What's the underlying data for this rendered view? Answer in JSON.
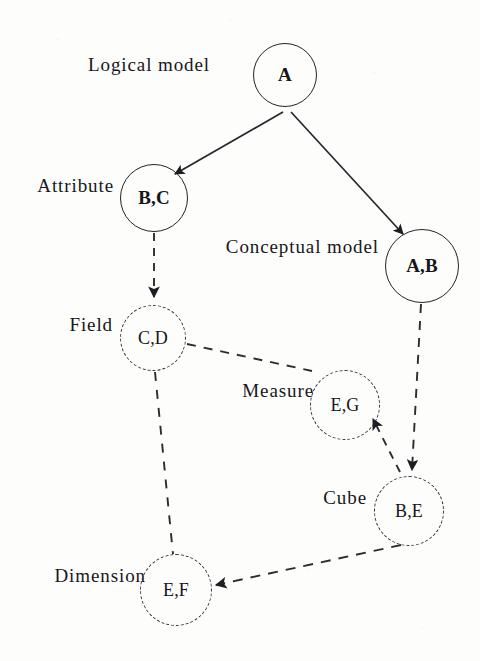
{
  "diagram": {
    "width": 480,
    "height": 661,
    "background_color": "#fdfdfc",
    "ink_color": "#23232a",
    "tier_labels": [
      {
        "id": "logical-model",
        "text": "Logical model",
        "x": 210,
        "y": 67
      },
      {
        "id": "attribute",
        "text": "Attribute",
        "x": 114,
        "y": 188
      },
      {
        "id": "conceptual-model",
        "text": "Conceptual model",
        "x": 379,
        "y": 249
      },
      {
        "id": "field",
        "text": "Field",
        "x": 113,
        "y": 327
      },
      {
        "id": "measure",
        "text": "Measure",
        "x": 314,
        "y": 393
      },
      {
        "id": "cube",
        "text": "Cube",
        "x": 367,
        "y": 500
      },
      {
        "id": "dimension",
        "text": "Dimension",
        "x": 146,
        "y": 578
      }
    ],
    "nodes": [
      {
        "id": "node-a",
        "label": "A",
        "cx": 285,
        "cy": 75,
        "r": 32,
        "style": "solid"
      },
      {
        "id": "node-bc",
        "label": "B,C",
        "cx": 154,
        "cy": 198,
        "r": 34,
        "style": "solid"
      },
      {
        "id": "node-ab",
        "label": "A,B",
        "cx": 422,
        "cy": 266,
        "r": 37,
        "style": "solid"
      },
      {
        "id": "node-cd",
        "label": "C,D",
        "cx": 153,
        "cy": 338,
        "r": 33,
        "style": "dashed"
      },
      {
        "id": "node-eg",
        "label": "E,G",
        "cx": 345,
        "cy": 405,
        "r": 35,
        "style": "dashed"
      },
      {
        "id": "node-be",
        "label": "B,E",
        "cx": 409,
        "cy": 511,
        "r": 35,
        "style": "dashed"
      },
      {
        "id": "node-ef",
        "label": "E,F",
        "cx": 176,
        "cy": 590,
        "r": 36,
        "style": "dashed"
      }
    ],
    "edges": [
      {
        "id": "edge-a-bc",
        "from": "node-a",
        "to": "node-bc",
        "style": "solid",
        "arrow": true
      },
      {
        "id": "edge-a-ab",
        "from": "node-a",
        "to": "node-ab",
        "style": "solid",
        "arrow": true
      },
      {
        "id": "edge-bc-cd",
        "from": "node-bc",
        "to": "node-cd",
        "style": "dashed",
        "arrow": true
      },
      {
        "id": "edge-ab-be",
        "from": "node-ab",
        "to": "node-be",
        "style": "dashed",
        "arrow": true
      },
      {
        "id": "edge-cd-eg",
        "from": "node-cd",
        "to": "node-eg",
        "style": "dashed",
        "arrow": false
      },
      {
        "id": "edge-be-eg",
        "from": "node-be",
        "to": "node-eg",
        "style": "dashed",
        "arrow": true
      },
      {
        "id": "edge-cd-ef",
        "from": "node-cd",
        "to": "node-ef",
        "style": "dashed",
        "arrow": false
      },
      {
        "id": "edge-be-ef",
        "from": "node-be",
        "to": "node-ef",
        "style": "dashed",
        "arrow": true
      }
    ]
  }
}
